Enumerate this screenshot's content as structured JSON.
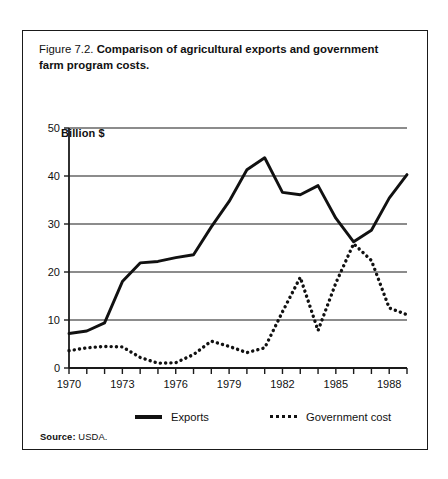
{
  "figure": {
    "caption_number": "Figure 7.2.",
    "caption_text": "Comparison of agricultural exports and government farm program costs.",
    "source_label": "Source:",
    "source_value": "USDA.",
    "frame_color": "#1a1a1a"
  },
  "legend": {
    "position": "bottom",
    "entries": [
      {
        "label": "Exports",
        "style": "solid",
        "color": "#111111"
      },
      {
        "label": "Government cost",
        "style": "dotted",
        "color": "#111111"
      }
    ]
  },
  "chart_data": {
    "type": "line",
    "title": "Comparison of agricultural exports and government farm program costs.",
    "xlabel": "",
    "ylabel": "Billion $",
    "ylim": [
      0,
      50
    ],
    "xlim": [
      1970,
      1989
    ],
    "grid": true,
    "y_ticks": [
      0,
      10,
      20,
      30,
      40,
      50
    ],
    "y_tick_labels": [
      "0",
      "10",
      "20",
      "30",
      "40",
      "50"
    ],
    "x_ticks": [
      1970,
      1971,
      1972,
      1973,
      1974,
      1975,
      1976,
      1977,
      1978,
      1979,
      1980,
      1981,
      1982,
      1983,
      1984,
      1985,
      1986,
      1987,
      1988,
      1989
    ],
    "x_tick_labels": [
      "1970",
      "",
      "",
      "1973",
      "",
      "",
      "1976",
      "",
      "",
      "1979",
      "",
      "",
      "1982",
      "",
      "",
      "1985",
      "",
      "",
      "1988",
      ""
    ],
    "x": [
      1970,
      1971,
      1972,
      1973,
      1974,
      1975,
      1976,
      1977,
      1978,
      1979,
      1980,
      1981,
      1982,
      1983,
      1984,
      1985,
      1986,
      1987,
      1988,
      1989
    ],
    "series": [
      {
        "name": "Exports",
        "style": "solid",
        "color": "#111111",
        "values": [
          7.2,
          7.7,
          9.4,
          18.0,
          21.9,
          22.2,
          23.0,
          23.6,
          29.4,
          34.7,
          41.3,
          43.8,
          36.6,
          36.1,
          38.0,
          31.2,
          26.3,
          28.7,
          35.4,
          40.3
        ]
      },
      {
        "name": "Government cost",
        "style": "dotted",
        "color": "#111111",
        "values": [
          3.6,
          4.2,
          4.5,
          4.4,
          2.2,
          1.0,
          1.1,
          2.8,
          5.6,
          4.5,
          3.2,
          4.2,
          11.7,
          18.9,
          7.8,
          17.7,
          25.9,
          22.4,
          12.5,
          11.1
        ]
      }
    ]
  }
}
